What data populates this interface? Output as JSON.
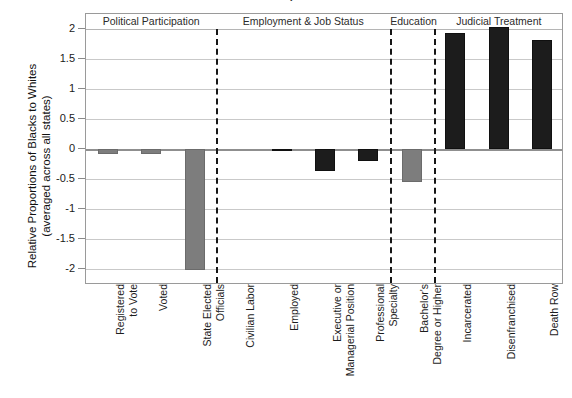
{
  "chart_data": {
    "type": "bar",
    "title": "Relative Proportions",
    "ylabel_line1": "Relative Proportions of Blacks to Whites",
    "ylabel_line2": "(averaged across all states)",
    "xlabel": "",
    "ylim": [
      -2,
      2
    ],
    "ytick_labels": [
      "2",
      "1.5",
      "1",
      "0.5",
      "0",
      "-0.5",
      "-1",
      "-1.5",
      "-2"
    ],
    "ytick_values": [
      2,
      1.5,
      1,
      0.5,
      0,
      -0.5,
      -1,
      -1.5,
      -2
    ],
    "grid": true,
    "legend": "none",
    "categories": [
      "Registered to Vote",
      "Voted",
      "State Elected Officials",
      "Civilian Labor",
      "Employed",
      "Executive or Managerial Position",
      "Professional Specialty",
      "Bachelor's Degree or Higher",
      "Incarcerated",
      "Disenfranchised",
      "Death Row"
    ],
    "category_lines": [
      [
        "Registered",
        "to Vote"
      ],
      [
        "Voted",
        ""
      ],
      [
        "State Elected",
        "Officials"
      ],
      [
        "Civilian Labor",
        ""
      ],
      [
        "Employed",
        ""
      ],
      [
        "Executive or",
        "Managerial Position"
      ],
      [
        "Professional",
        "Specialty"
      ],
      [
        "Bachelor's",
        "Degree or Higher"
      ],
      [
        "Incarcerated",
        ""
      ],
      [
        "Disenfranchised",
        ""
      ],
      [
        "Death Row",
        ""
      ]
    ],
    "values": [
      -0.08,
      -0.08,
      -2.02,
      0.0,
      -0.03,
      -0.37,
      -0.2,
      -0.55,
      1.93,
      2.03,
      1.82
    ],
    "bar_colors": [
      "#7d7d7d",
      "#7d7d7d",
      "#7d7d7d",
      "#7d7d7d",
      "#1c1c1c",
      "#1c1c1c",
      "#1c1c1c",
      "#7d7d7d",
      "#1c1c1c",
      "#1c1c1c",
      "#1c1c1c"
    ],
    "groups": [
      {
        "label": "Political Participation",
        "start": 0,
        "end": 2
      },
      {
        "label": "Employment & Job Status",
        "start": 3,
        "end": 6
      },
      {
        "label": "Education",
        "start": 7,
        "end": 7
      },
      {
        "label": "Judicial Treatment",
        "start": 8,
        "end": 10
      }
    ],
    "colors": {
      "bar_gray": "#7d7d7d",
      "bar_black": "#1c1c1c",
      "gridline": "#c9c9c9",
      "zero_line": "#8f8f8f",
      "separator": "#161616",
      "frame": "#9a9a9a",
      "background": "#ffffff"
    }
  }
}
